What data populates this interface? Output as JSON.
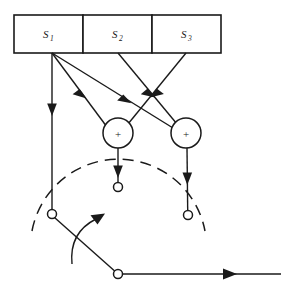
{
  "diagram": {
    "type": "schematic",
    "background_color": "#ffffff",
    "line_color": "#1a1a1a",
    "registers": [
      {
        "id": "s1",
        "label": "S",
        "subscript": "1",
        "x": 14,
        "y": 15,
        "width": 69,
        "height": 38,
        "label_x": 48.5,
        "label_y": 38
      },
      {
        "id": "s2",
        "label": "S",
        "subscript": "2",
        "x": 83,
        "y": 15,
        "width": 69,
        "height": 38,
        "label_x": 117.5,
        "label_y": 38
      },
      {
        "id": "s3",
        "label": "S",
        "subscript": "3",
        "x": 152,
        "y": 15,
        "width": 69,
        "height": 38,
        "label_x": 186.5,
        "label_y": 38
      }
    ],
    "adders": [
      {
        "id": "adder-left",
        "symbol": "+",
        "cx": 118,
        "cy": 133,
        "r": 15
      },
      {
        "id": "adder-right",
        "symbol": "+",
        "cx": 186,
        "cy": 133,
        "r": 15
      }
    ],
    "tap_junction": {
      "x": 52,
      "y": 53
    },
    "contacts": [
      {
        "id": "contact-left",
        "cx": 52,
        "cy": 214,
        "r": 4.5
      },
      {
        "id": "contact-middle",
        "cx": 118,
        "cy": 187,
        "r": 4.5
      },
      {
        "id": "contact-right",
        "cx": 188,
        "cy": 215,
        "r": 4.5
      }
    ],
    "pivot": {
      "id": "switch-pivot",
      "cx": 118,
      "cy": 274,
      "r": 4.5
    },
    "commutator_arc": {
      "path": "M 32 231 A 88 88 0 0 1 205 231",
      "dash": "11 7"
    },
    "switch_arm": {
      "x1": 118,
      "y1": 274,
      "x2": 54,
      "y2": 217
    },
    "rotation_arrow": {
      "path": "M 73 262 C 73 242 80 228 98 220",
      "tip": "104,213 91,219 99,226"
    },
    "output_line": {
      "x1": 118,
      "y1": 274,
      "x2": 281,
      "y2": 274
    },
    "output_arrow_tip": "237,274 224,268.6 224,279.4",
    "connections": [
      {
        "id": "s1-to-contact-left",
        "from": "tap_junction",
        "to": "contact-left",
        "x1": 52,
        "y1": 53,
        "x2": 52,
        "y2": 209.5,
        "arrow_at": 0.37
      },
      {
        "id": "s1-to-adder-right",
        "from": "tap_junction",
        "to": "adder-right",
        "x1": 52,
        "y1": 53,
        "x2": 172.5,
        "y2": 127.5,
        "arrow_at": 0.52
      },
      {
        "id": "s1-to-adder-left",
        "from": "tap_junction",
        "to": "adder-left",
        "x1": 52,
        "y1": 53,
        "x2": 106.5,
        "y2": 126.5,
        "arrow_at": 0.47
      },
      {
        "id": "s2-to-adder-right",
        "from": "s2",
        "to": "adder-right",
        "x1": 118,
        "y1": 53,
        "x2": 176.5,
        "y2": 123.5,
        "arrow_at": 0.63
      },
      {
        "id": "s3-to-adder-left",
        "from": "s3",
        "to": "adder-left",
        "x1": 186,
        "y1": 53,
        "x2": 127.5,
        "y2": 123.5,
        "arrow_at": 0.63
      },
      {
        "id": "adder-left-to-contact-middle",
        "from": "adder-left",
        "to": "contact-middle",
        "x1": 118,
        "y1": 148,
        "x2": 118,
        "y2": 182.5,
        "arrow_at": 0.62
      },
      {
        "id": "adder-right-to-contact-right",
        "from": "adder-right",
        "to": "contact-right",
        "x1": 187,
        "y1": 148,
        "x2": 187.5,
        "y2": 210.5,
        "arrow_at": 0.45
      }
    ]
  }
}
